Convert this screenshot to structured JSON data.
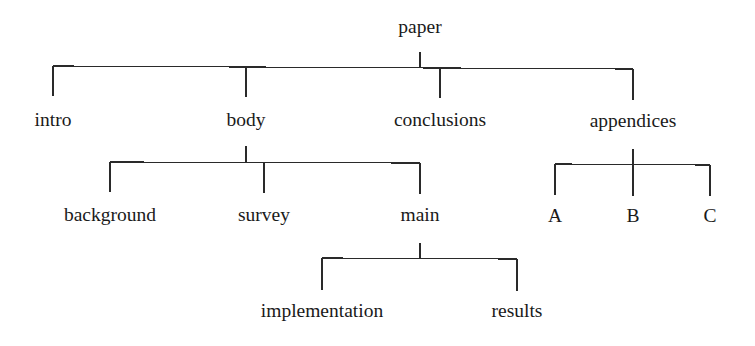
{
  "diagram": {
    "type": "tree",
    "line_color": "#2a2a2a",
    "text_color": "#1a1a1a",
    "nodes": [
      {
        "id": "paper",
        "label": "paper",
        "x": 420,
        "y": 33
      },
      {
        "id": "intro",
        "label": "intro",
        "x": 53,
        "y": 126,
        "parent": "paper"
      },
      {
        "id": "body",
        "label": "body",
        "x": 246,
        "y": 126,
        "parent": "paper"
      },
      {
        "id": "conclusions",
        "label": "conclusions",
        "x": 440,
        "y": 126,
        "parent": "paper"
      },
      {
        "id": "appendices",
        "label": "appendices",
        "x": 633,
        "y": 126,
        "parent": "paper"
      },
      {
        "id": "background",
        "label": "background",
        "x": 110,
        "y": 221,
        "parent": "body"
      },
      {
        "id": "survey",
        "label": "survey",
        "x": 264,
        "y": 221,
        "parent": "body"
      },
      {
        "id": "main",
        "label": "main",
        "x": 420,
        "y": 221,
        "parent": "body"
      },
      {
        "id": "A",
        "label": "A",
        "x": 555,
        "y": 221,
        "parent": "appendices"
      },
      {
        "id": "B",
        "label": "B",
        "x": 633,
        "y": 221,
        "parent": "appendices"
      },
      {
        "id": "C",
        "label": "C",
        "x": 710,
        "y": 221,
        "parent": "appendices"
      },
      {
        "id": "implementation",
        "label": "implementation",
        "x": 322,
        "y": 317,
        "parent": "main"
      },
      {
        "id": "results",
        "label": "results",
        "x": 517,
        "y": 317,
        "parent": "main"
      }
    ],
    "edges": [
      {
        "from": "paper",
        "to": [
          "intro",
          "body",
          "conclusions",
          "appendices"
        ]
      },
      {
        "from": "body",
        "to": [
          "background",
          "survey",
          "main"
        ]
      },
      {
        "from": "appendices",
        "to": [
          "A",
          "B",
          "C"
        ]
      },
      {
        "from": "main",
        "to": [
          "implementation",
          "results"
        ]
      }
    ]
  }
}
